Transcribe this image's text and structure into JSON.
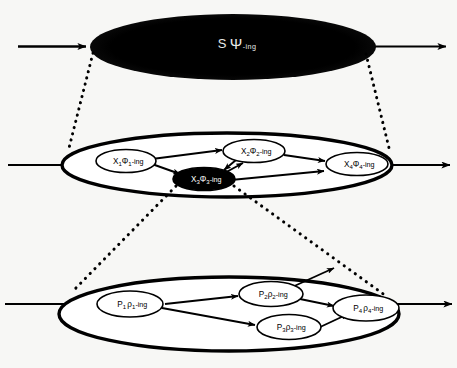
{
  "diagram": {
    "type": "nested-process-decomposition",
    "background_color": "#f7f7f5",
    "stroke_color": "#000000",
    "fill_white": "#ffffff",
    "fill_black": "#000000"
  },
  "levels": [
    {
      "id": "level-1",
      "name": "top-level-process",
      "shape": "filled-ellipse",
      "fill": "#000000",
      "label_color": "#e8e8e8",
      "label": {
        "base": "S",
        "glyph": "Ψ",
        "subscript": "",
        "suffix": "-ing",
        "full": "S Ψ-ing"
      },
      "input_arrow": "in-arrow-level-1",
      "output_arrow": "out-arrow-level-1"
    },
    {
      "id": "level-2",
      "name": "middle-level-process",
      "shape": "outlined-ellipse",
      "fill": "#ffffff",
      "input_arrow": "in-arrow-level-2",
      "output_arrow": "out-arrow-level-2",
      "nodes": [
        {
          "id": "x1",
          "base": "X",
          "sub": "1",
          "glyph": "Φ",
          "glyph_sub": "1",
          "suffix": "-ing",
          "full": "X₁Φ₁-ing",
          "fill": "#ffffff",
          "text_color": "#000000"
        },
        {
          "id": "x2",
          "base": "X",
          "sub": "2",
          "glyph": "Φ",
          "glyph_sub": "2",
          "suffix": "-ing",
          "full": "X₂Φ₂-ing",
          "fill": "#ffffff",
          "text_color": "#000000"
        },
        {
          "id": "x3",
          "base": "X",
          "sub": "3",
          "glyph": "Φ",
          "glyph_sub": "3",
          "suffix": "-ing",
          "full": "X₃Φ₃-ing",
          "fill": "#000000",
          "text_color": "#ffffff"
        },
        {
          "id": "x4",
          "base": "X",
          "sub": "4",
          "glyph": "Φ",
          "glyph_sub": "4",
          "suffix": "-ing",
          "full": "X₄Φ₄-ing",
          "fill": "#ffffff",
          "text_color": "#000000"
        }
      ],
      "edges": [
        {
          "from": "x1",
          "to": "x2"
        },
        {
          "from": "x1",
          "to": "x3"
        },
        {
          "from": "x3",
          "to": "x2"
        },
        {
          "from": "x2",
          "to": "x3"
        },
        {
          "from": "x2",
          "to": "x4"
        },
        {
          "from": "x3",
          "to": "x4"
        }
      ]
    },
    {
      "id": "level-3",
      "name": "bottom-level-process",
      "shape": "outlined-ellipse",
      "fill": "#ffffff",
      "input_arrow": "in-arrow-level-3",
      "output_arrow": "out-arrow-level-3",
      "nodes": [
        {
          "id": "p1",
          "base": "P",
          "sub": "1",
          "glyph": "ρ",
          "glyph_sub": "1",
          "suffix": "-ing",
          "full": "P₁ρ₁-ing",
          "fill": "#ffffff",
          "text_color": "#000000"
        },
        {
          "id": "p2",
          "base": "P",
          "sub": "2",
          "glyph": "ρ",
          "glyph_sub": "2",
          "suffix": "-ing",
          "full": "P₂ρ₂-ing",
          "fill": "#ffffff",
          "text_color": "#000000"
        },
        {
          "id": "p3",
          "base": "P",
          "sub": "3",
          "glyph": "ρ",
          "glyph_sub": "3",
          "suffix": "-ing",
          "full": "P₃ρ₃-ing",
          "fill": "#ffffff",
          "text_color": "#000000"
        },
        {
          "id": "p4",
          "base": "P",
          "sub": "4",
          "glyph": "ρ",
          "glyph_sub": "4",
          "suffix": "-ing",
          "full": "P₄ρ₄-ing",
          "fill": "#ffffff",
          "text_color": "#000000"
        }
      ],
      "edges": [
        {
          "from": "p1",
          "to": "p2"
        },
        {
          "from": "p1",
          "to": "p3"
        },
        {
          "from": "p2",
          "to": "p4"
        },
        {
          "from": "p2",
          "to": "outside-upper-right"
        },
        {
          "from": "p3",
          "to": "p4"
        }
      ]
    }
  ],
  "connectors": [
    {
      "id": "zoom-left-1-2",
      "style": "dotted",
      "from": "level-1-left",
      "to": "level-2-left"
    },
    {
      "id": "zoom-right-1-2",
      "style": "dotted",
      "from": "level-1-right",
      "to": "level-2-right"
    },
    {
      "id": "zoom-left-2-3",
      "style": "dotted",
      "from": "level-2-x3-left",
      "to": "level-3-left"
    },
    {
      "id": "zoom-right-2-3",
      "style": "dotted",
      "from": "level-2-x3-right",
      "to": "level-3-right"
    }
  ]
}
